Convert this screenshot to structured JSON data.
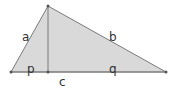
{
  "diagram": {
    "colors": {
      "fill": "#d9d9d9",
      "stroke": "#7a7a7a",
      "point": "#555555",
      "label": "#333333"
    },
    "vertices": {
      "apex": [
        48,
        6
      ],
      "left": [
        11,
        72
      ],
      "right": [
        166,
        72
      ],
      "foot": [
        48,
        72
      ]
    },
    "labels": {
      "a": "a",
      "b": "b",
      "c": "c",
      "p": "p",
      "q": "q"
    }
  }
}
